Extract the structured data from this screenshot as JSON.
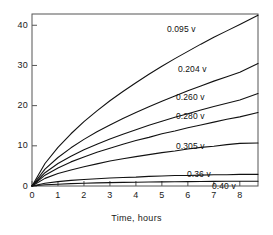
{
  "chart_data": {
    "type": "line",
    "title": "",
    "xlabel": "Time, hours",
    "ylabel": "",
    "xlim": [
      0,
      8.7
    ],
    "ylim": [
      0,
      42.8
    ],
    "grid": false,
    "legend_position": "inline-curve-labels",
    "xticks": [
      "0",
      "1",
      "2",
      "3",
      "4",
      "5",
      "6",
      "7",
      "8"
    ],
    "xtick_values": [
      0,
      1,
      2,
      3,
      4,
      5,
      6,
      7,
      8
    ],
    "yticks": [
      "0",
      "10",
      "20",
      "30",
      "40"
    ],
    "ytick_values": [
      0,
      10,
      20,
      30,
      40
    ],
    "x": [
      0,
      0.5,
      1,
      1.5,
      2,
      2.5,
      3,
      3.5,
      4,
      4.5,
      5,
      5.5,
      6,
      6.5,
      7,
      7.5,
      8,
      8.7
    ],
    "series": [
      {
        "name": "0.095 v",
        "label": "0.095 v",
        "values": [
          0,
          5.6,
          9.6,
          13.0,
          16.0,
          18.7,
          21.2,
          23.5,
          25.7,
          27.8,
          29.8,
          31.7,
          33.5,
          35.3,
          37.0,
          38.6,
          40.2,
          42.5
        ]
      },
      {
        "name": "0.204 v",
        "label": "0.204 v",
        "values": [
          0,
          4.2,
          7.1,
          9.5,
          11.6,
          13.5,
          15.2,
          16.8,
          18.3,
          19.7,
          21.1,
          22.4,
          23.7,
          24.9,
          26.1,
          27.2,
          28.3,
          30.5
        ]
      },
      {
        "name": "0.260 v",
        "label": "0.260 v",
        "values": [
          0,
          3.3,
          5.6,
          7.4,
          9.0,
          10.4,
          11.7,
          12.9,
          14.0,
          15.1,
          16.1,
          17.1,
          18.0,
          18.9,
          19.8,
          20.6,
          21.4,
          23.0
        ]
      },
      {
        "name": "0.280 v",
        "label": "0.280 v",
        "values": [
          0,
          2.7,
          4.5,
          6.0,
          7.2,
          8.4,
          9.4,
          10.4,
          11.3,
          12.1,
          13.0,
          13.7,
          14.5,
          15.2,
          15.9,
          16.6,
          17.2,
          18.3
        ]
      },
      {
        "name": "0.305 v",
        "label": "0.305 v",
        "values": [
          0,
          1.9,
          3.1,
          4.0,
          4.8,
          5.5,
          6.2,
          6.8,
          7.3,
          7.8,
          8.3,
          8.7,
          9.2,
          9.6,
          9.9,
          10.3,
          10.6,
          10.7
        ]
      },
      {
        "name": "0.36 v",
        "label": "0.36 v",
        "values": [
          0,
          0.7,
          1.1,
          1.4,
          1.6,
          1.8,
          2.0,
          2.1,
          2.2,
          2.4,
          2.5,
          2.6,
          2.6,
          2.7,
          2.8,
          2.8,
          2.9,
          2.9
        ]
      },
      {
        "name": "0.40 v",
        "label": "0.40 v",
        "values": [
          0,
          0.3,
          0.45,
          0.6,
          0.7,
          0.78,
          0.85,
          0.9,
          0.95,
          1.0,
          1.03,
          1.07,
          1.1,
          1.12,
          1.15,
          1.17,
          1.19,
          1.2
        ]
      }
    ],
    "curve_label_positions": [
      {
        "label": "0.095 v",
        "x": 167,
        "y": 25
      },
      {
        "label": "0.204 v",
        "x": 178,
        "y": 65
      },
      {
        "label": "0.260 v",
        "x": 176,
        "y": 93
      },
      {
        "label": "0.280 v",
        "x": 176,
        "y": 112
      },
      {
        "label": "0.305 v",
        "x": 176,
        "y": 142
      },
      {
        "label": "0.36 v",
        "x": 187,
        "y": 170
      },
      {
        "label": "0.40 v",
        "x": 212,
        "y": 182
      }
    ]
  },
  "axes": {
    "frame": {
      "left": 32,
      "right": 258,
      "top": 14,
      "bottom": 186
    },
    "line_color": "#555555",
    "curve_color": "#111111"
  }
}
